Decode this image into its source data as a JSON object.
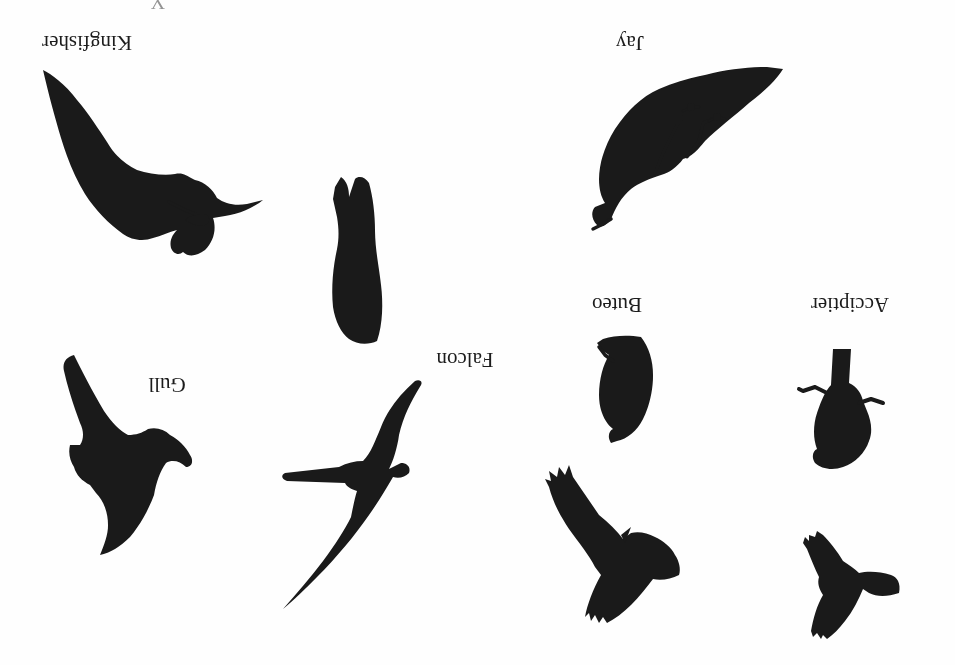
{
  "diagram": {
    "type": "bird silhouette identification chart",
    "orientation": "rotated 180 degrees (scanned upside down)",
    "background_color": "#fefefe",
    "ink_color": "#1a1a1a",
    "groups": [
      {
        "id": "kingfisher",
        "label": "Kingfisher",
        "silhouettes": [
          "perched"
        ]
      },
      {
        "id": "jay",
        "label": "Jay",
        "silhouettes": [
          "perched"
        ]
      },
      {
        "id": "acciptier",
        "label": "Acciptier",
        "silhouettes": [
          "perched",
          "flying"
        ]
      },
      {
        "id": "buteo",
        "label": "Buteo",
        "silhouettes": [
          "perched",
          "flying"
        ]
      },
      {
        "id": "falcon",
        "label": "Falcon",
        "silhouettes": [
          "perched",
          "flying"
        ]
      },
      {
        "id": "gull",
        "label": "Gull",
        "silhouettes": [
          "flying"
        ]
      }
    ],
    "partial_top_text": "Y"
  },
  "labels": {
    "kingfisher": "Kingfisher",
    "jay": "Jay",
    "acciptier": "Acciptier",
    "buteo": "Buteo",
    "falcon": "Falcon",
    "gull": "Gull"
  }
}
